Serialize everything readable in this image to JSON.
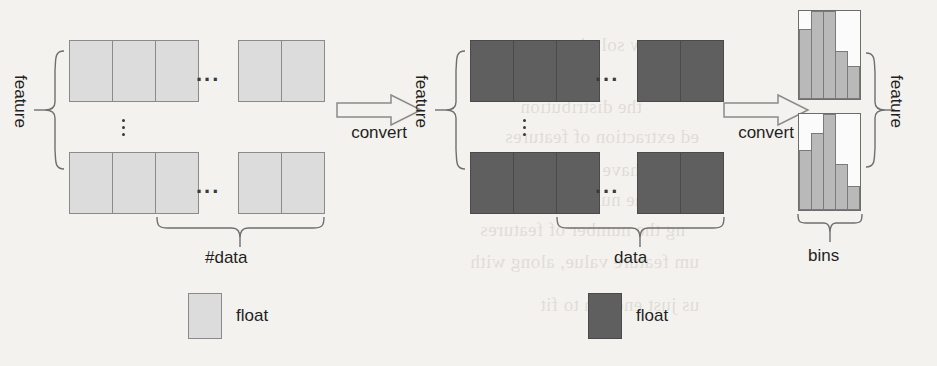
{
  "figure": {
    "type": "diagram"
  },
  "stages": [
    {
      "id": "stage-floats-light",
      "fill": "#dcdcdc",
      "row_top": {
        "left_cells": 3,
        "right_cells": 2
      },
      "row_bottom": {
        "left_cells": 3,
        "right_cells": 2
      },
      "row_ellipsis": "vertical",
      "col_ellipsis": "...",
      "bracket_left_label": "feature",
      "bracket_bottom_label": "#data"
    },
    {
      "id": "stage-floats-dark",
      "fill": "#5f5f5f",
      "row_top": {
        "left_cells": 3,
        "right_cells": 2
      },
      "row_bottom": {
        "left_cells": 3,
        "right_cells": 2
      },
      "row_ellipsis": "vertical",
      "col_ellipsis": "...",
      "bracket_left_label": "feature",
      "bracket_bottom_label": "data"
    },
    {
      "id": "stage-bins",
      "bracket_right_label": "feature",
      "bracket_bottom_label": "bins"
    }
  ],
  "arrows": [
    {
      "id": "convert-1",
      "label": "convert",
      "direction": "right"
    },
    {
      "id": "convert-2",
      "label": "convert",
      "direction": "right"
    }
  ],
  "chart_data": {
    "type": "bar",
    "title": "bins",
    "xlabel": "bins",
    "ylabel": "feature",
    "ylim": [
      0,
      100
    ],
    "bar_fill": "#b9b9b9",
    "categories": [
      "1",
      "2",
      "3",
      "4",
      "5"
    ],
    "series": [
      {
        "name": "feature-row-1",
        "values": [
          80,
          100,
          100,
          55,
          38
        ]
      },
      {
        "name": "feature-row-2",
        "values": [
          62,
          80,
          100,
          48,
          25
        ]
      }
    ]
  },
  "legend": [
    {
      "id": "legend-light",
      "swatch": "light",
      "color": "#dcdcdc",
      "label": "float"
    },
    {
      "id": "legend-dark",
      "swatch": "dark",
      "color": "#5f5f5f",
      "label": "float"
    }
  ],
  "bleed_text": [
    "a new solution",
    "the distribution",
    "ed extraction of features",
    "have solved",
    "at the number of bins",
    "ng the number of features",
    "um feature value, along with",
    "us just enough to fit"
  ]
}
